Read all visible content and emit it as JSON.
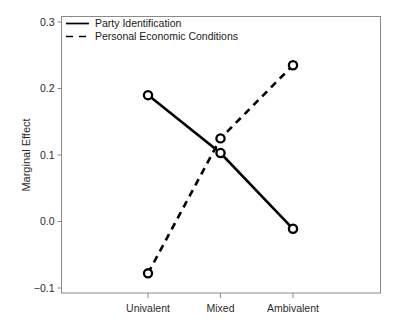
{
  "chart_data": {
    "type": "line",
    "title": "",
    "xlabel": "",
    "ylabel": "Marginal Effect",
    "categories": [
      "Univalent",
      "Mixed",
      "Ambivalent"
    ],
    "ylim": [
      -0.1,
      0.3
    ],
    "yticks": [
      0.3,
      0.2,
      0.1,
      0.0,
      -0.1
    ],
    "ytick_labels": [
      "0.3",
      "0.2",
      "0.1",
      "0.0",
      "−0.1"
    ],
    "grid": false,
    "legend_position": "top-left",
    "series": [
      {
        "name": "Party Identification",
        "style": "solid",
        "marker": "open-circle",
        "color": "#000000",
        "values": [
          0.19,
          0.103,
          -0.011
        ]
      },
      {
        "name": "Personal Economic Conditions",
        "style": "dashed",
        "marker": "open-circle",
        "color": "#000000",
        "values": [
          -0.078,
          0.125,
          0.235
        ]
      }
    ]
  },
  "axis": {
    "y_title": "Marginal Effect"
  },
  "legend": {
    "entries": [
      {
        "label": "Party Identification",
        "style": "solid"
      },
      {
        "label": "Personal Economic Conditions",
        "style": "dashed"
      }
    ]
  }
}
